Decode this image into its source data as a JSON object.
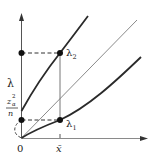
{
  "diagram": {
    "type": "function-plot",
    "colors": {
      "axis": "#555555",
      "curve": "#2a2a2a",
      "diagonal": "#8a8a8a",
      "dashed": "#333333",
      "point": "#111111",
      "text": "#1a1a1a"
    },
    "labels": {
      "y_axis": "λ",
      "origin": "0",
      "x_tick": "x̄",
      "intercept_numerator": "z",
      "intercept_sup": "2",
      "intercept_sub": "α",
      "intercept_denominator": "n",
      "upper_point": "λ",
      "upper_point_sub": "2",
      "lower_point": "λ",
      "lower_point_sub": "1"
    },
    "elements": [
      {
        "name": "upper-curve",
        "desc": "concave curve starting at intercept z²/n on λ axis"
      },
      {
        "name": "diagonal-line",
        "desc": "gray reference line λ = x through origin"
      },
      {
        "name": "lower-curve",
        "desc": "convex curve starting at origin"
      },
      {
        "name": "vertical-segment",
        "desc": "solid line at x̄ from λ1 to λ2"
      },
      {
        "name": "dashed-guides",
        "desc": "horizontal dashed lines from λ1 and λ2 to λ axis"
      }
    ]
  }
}
